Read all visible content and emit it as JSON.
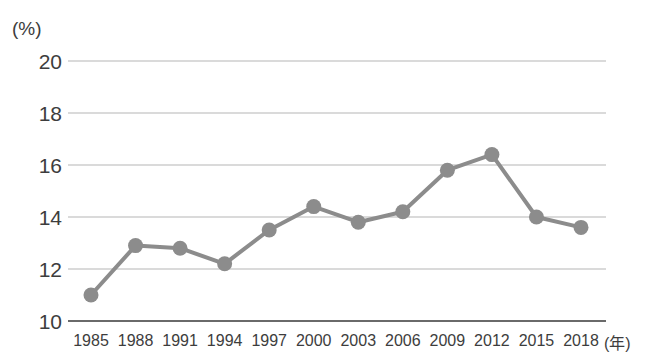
{
  "chart_data": {
    "type": "line",
    "title": "",
    "xlabel": "(年)",
    "ylabel": "(%)",
    "categories": [
      "1985",
      "1988",
      "1991",
      "1994",
      "1997",
      "2000",
      "2003",
      "2006",
      "2009",
      "2012",
      "2015",
      "2018"
    ],
    "values": [
      11.0,
      12.9,
      12.8,
      12.2,
      13.5,
      14.4,
      13.8,
      14.2,
      15.8,
      16.4,
      14.0,
      13.6
    ],
    "yticks": [
      "20",
      "18",
      "16",
      "14",
      "12",
      "10"
    ],
    "ytick_values": [
      20,
      18,
      16,
      14,
      12,
      10
    ],
    "ylim": [
      10,
      20
    ],
    "grid": true,
    "legend": "none",
    "series": [
      {
        "name": "",
        "values": [
          11.0,
          12.9,
          12.8,
          12.2,
          13.5,
          14.4,
          13.8,
          14.2,
          15.8,
          16.4,
          14.0,
          13.6
        ]
      }
    ],
    "colors": {
      "line": "#8c8c8c",
      "marker": "#8c8c8c",
      "grid": "#b5b5b5",
      "axis": "#6a6a6a",
      "text": "#3d3d3d",
      "background": "#ffffff"
    }
  }
}
